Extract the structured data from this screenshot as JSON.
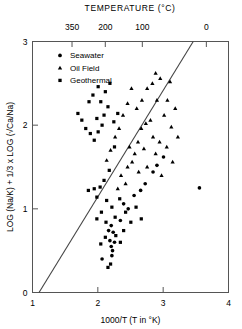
{
  "chart_data": {
    "type": "scatter",
    "title": "TEMPERATURE (°C)",
    "xlabel": "1000/T (T in °K)",
    "ylabel": "LOG (Na/K) + 1/3 x LOG (√Ca/Na)",
    "xlim": [
      1,
      4
    ],
    "ylim": [
      0,
      3
    ],
    "xticks": [
      1,
      2,
      3,
      4
    ],
    "yticks": [
      0,
      1,
      2,
      3
    ],
    "grid": false,
    "top_axis": {
      "label": "TEMPERATURE (°C)",
      "ticks": [
        {
          "label": "350",
          "x": 1.605
        },
        {
          "label": "200",
          "x": 2.114
        },
        {
          "label": "100",
          "x": 2.681
        },
        {
          "label": "0",
          "x": 3.661
        }
      ]
    },
    "legend": {
      "position": "upper-left-inside",
      "entries": [
        {
          "label": "Seawater",
          "marker": "circle"
        },
        {
          "label": "Oil Field",
          "marker": "triangle"
        },
        {
          "label": "Geothermal",
          "marker": "square"
        }
      ]
    },
    "trend_line": {
      "x": [
        1.1,
        3.46
      ],
      "y": [
        0.0,
        3.0
      ],
      "style": "solid",
      "color": "#444444"
    },
    "series": [
      {
        "name": "Seawater",
        "marker": "circle",
        "points": [
          [
            3.555,
            1.25
          ],
          [
            2.205,
            0.55
          ],
          [
            2.225,
            0.5
          ],
          [
            2.215,
            0.44
          ],
          [
            2.185,
            0.62
          ],
          [
            2.255,
            0.6
          ],
          [
            2.235,
            0.72
          ],
          [
            2.165,
            0.74
          ],
          [
            2.205,
            0.8
          ],
          [
            2.065,
            0.4
          ],
          [
            2.345,
            0.86
          ],
          [
            2.465,
            1.0
          ],
          [
            2.555,
            1.16
          ],
          [
            2.395,
            1.06
          ],
          [
            2.725,
            1.3
          ],
          [
            2.845,
            1.44
          ],
          [
            2.655,
            1.22
          ],
          [
            3.005,
            1.62
          ],
          [
            2.905,
            1.52
          ]
        ]
      },
      {
        "name": "Oil Field",
        "marker": "triangle",
        "points": [
          [
            2.885,
            2.62
          ],
          [
            2.955,
            2.56
          ],
          [
            2.905,
            2.3
          ],
          [
            3.065,
            2.3
          ],
          [
            3.015,
            2.12
          ],
          [
            2.805,
            2.06
          ],
          [
            2.735,
            2.02
          ],
          [
            2.665,
            1.96
          ],
          [
            2.845,
            1.86
          ],
          [
            2.945,
            1.8
          ],
          [
            2.615,
            1.8
          ],
          [
            2.705,
            1.72
          ],
          [
            2.565,
            1.66
          ],
          [
            2.485,
            1.74
          ],
          [
            2.525,
            1.56
          ],
          [
            2.455,
            1.5
          ],
          [
            2.625,
            1.44
          ],
          [
            2.755,
            1.5
          ],
          [
            2.355,
            1.4
          ],
          [
            2.885,
            1.66
          ],
          [
            3.125,
            1.98
          ],
          [
            3.185,
            2.2
          ],
          [
            2.425,
            1.3
          ],
          [
            2.305,
            1.24
          ],
          [
            3.055,
            1.74
          ],
          [
            3.225,
            1.86
          ],
          [
            2.975,
            1.4
          ],
          [
            3.145,
            1.56
          ],
          [
            2.515,
            2.44
          ],
          [
            2.455,
            2.26
          ],
          [
            2.385,
            2.12
          ],
          [
            2.325,
            1.96
          ],
          [
            2.265,
            1.86
          ],
          [
            2.595,
            2.2
          ],
          [
            2.675,
            2.3
          ],
          [
            2.755,
            2.44
          ],
          [
            2.835,
            2.5
          ],
          [
            3.105,
            2.52
          ],
          [
            2.195,
            1.7
          ],
          [
            2.135,
            1.58
          ]
        ]
      },
      {
        "name": "Geothermal",
        "marker": "square",
        "points": [
          [
            1.855,
            1.22
          ],
          [
            1.945,
            1.24
          ],
          [
            1.695,
            2.14
          ],
          [
            1.755,
            2.06
          ],
          [
            1.815,
            1.96
          ],
          [
            1.885,
            1.9
          ],
          [
            1.945,
            1.82
          ],
          [
            2.005,
            1.92
          ],
          [
            2.065,
            2.0
          ],
          [
            1.985,
            2.08
          ],
          [
            2.095,
            2.12
          ],
          [
            2.155,
            2.22
          ],
          [
            2.045,
            2.28
          ],
          [
            1.925,
            2.36
          ],
          [
            2.005,
            2.46
          ],
          [
            2.115,
            2.4
          ],
          [
            2.185,
            2.5
          ],
          [
            1.865,
            2.28
          ],
          [
            2.245,
            2.04
          ],
          [
            2.305,
            2.14
          ],
          [
            2.255,
            1.74
          ],
          [
            2.175,
            1.46
          ],
          [
            2.095,
            1.34
          ],
          [
            2.035,
            1.26
          ],
          [
            1.985,
            1.14
          ],
          [
            2.135,
            1.1
          ],
          [
            2.215,
            1.02
          ],
          [
            2.055,
            0.96
          ],
          [
            1.985,
            0.88
          ],
          [
            2.125,
            0.84
          ],
          [
            2.265,
            0.9
          ],
          [
            2.335,
            1.12
          ],
          [
            2.395,
            0.74
          ],
          [
            2.115,
            0.66
          ],
          [
            2.195,
            0.34
          ],
          [
            2.045,
            0.58
          ],
          [
            2.155,
            0.3
          ],
          [
            2.275,
            0.68
          ],
          [
            2.425,
            0.96
          ],
          [
            2.505,
            0.84
          ],
          [
            2.345,
            0.6
          ],
          [
            2.585,
            1.02
          ],
          [
            2.665,
            0.88
          ]
        ]
      }
    ]
  }
}
